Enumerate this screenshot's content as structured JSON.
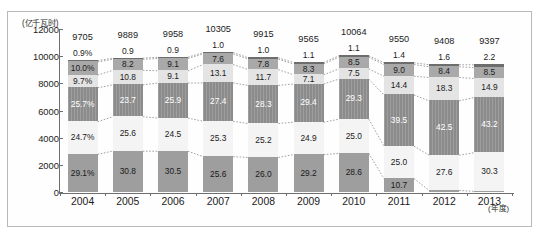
{
  "axis": {
    "unit_label": "(亿千瓦时)",
    "x_unit_label": "(年度)",
    "y_ticks": [
      12000,
      10000,
      8000,
      6000,
      4000,
      2000,
      0
    ]
  },
  "chart_data": {
    "type": "bar",
    "title": "",
    "xlabel": "(年度)",
    "ylabel": "(亿千瓦时)",
    "ylim": [
      0,
      12000
    ],
    "grid": false,
    "legend_position": "none",
    "stacked": true,
    "categories": [
      "2004",
      "2005",
      "2006",
      "2007",
      "2008",
      "2009",
      "2010",
      "2011",
      "2012",
      "2013"
    ],
    "totals": [
      9705,
      9889,
      9958,
      10305,
      9915,
      9565,
      10064,
      9550,
      9408,
      9397
    ],
    "series": [
      {
        "name": "band-1-top",
        "values": [
          0.9,
          0.9,
          0.9,
          1.0,
          1.0,
          1.1,
          1.1,
          1.4,
          1.6,
          2.2
        ],
        "labels": [
          "0.9%",
          "0.9",
          "0.9",
          "1.0",
          "1.0",
          "1.1",
          "1.1",
          "1.4",
          "1.6",
          "2.2"
        ],
        "color": "#6d6d6d"
      },
      {
        "name": "band-2",
        "values": [
          10.0,
          8.2,
          9.1,
          7.6,
          7.8,
          8.3,
          8.5,
          9.0,
          8.4,
          8.5
        ],
        "labels": [
          "10.0%",
          "8.2",
          "9.1",
          "7.6",
          "7.8",
          "8.3",
          "8.5",
          "9.0",
          "8.4",
          "8.5"
        ],
        "color": "#a9a9a9"
      },
      {
        "name": "band-3",
        "values": [
          9.7,
          10.8,
          9.1,
          13.1,
          11.7,
          7.1,
          7.5,
          14.4,
          18.3,
          14.9
        ],
        "labels": [
          "9.7%",
          "10.8",
          "9.1",
          "13.1",
          "11.7",
          "7.1",
          "7.5",
          "14.4",
          "18.3",
          "14.9"
        ],
        "color": "#e4e4e4"
      },
      {
        "name": "band-4",
        "values": [
          25.7,
          23.7,
          25.9,
          27.4,
          28.3,
          29.4,
          29.3,
          39.5,
          42.5,
          43.2
        ],
        "labels": [
          "25.7%",
          "23.7",
          "25.9",
          "27.4",
          "28.3",
          "29.4",
          "29.3",
          "39.5",
          "42.5",
          "43.2"
        ],
        "color": "#8b8b8b"
      },
      {
        "name": "band-5",
        "values": [
          24.7,
          25.6,
          24.5,
          25.3,
          25.2,
          24.9,
          25.0,
          25.0,
          27.6,
          30.3
        ],
        "labels": [
          "24.7%",
          "25.6",
          "24.5",
          "25.3",
          "25.2",
          "24.9",
          "25.0",
          "25.0",
          "27.6",
          "30.3"
        ],
        "color": "#f4f4f4"
      },
      {
        "name": "band-6-bottom",
        "values": [
          29.1,
          30.8,
          30.5,
          25.6,
          26.0,
          29.2,
          28.6,
          10.7,
          1.7,
          1.0
        ],
        "labels": [
          "29.1%",
          "30.8",
          "30.5",
          "25.6",
          "26.0",
          "29.2",
          "28.6",
          "10.7",
          "1.7",
          "1.0"
        ],
        "color": "#9e9e9e"
      }
    ]
  }
}
